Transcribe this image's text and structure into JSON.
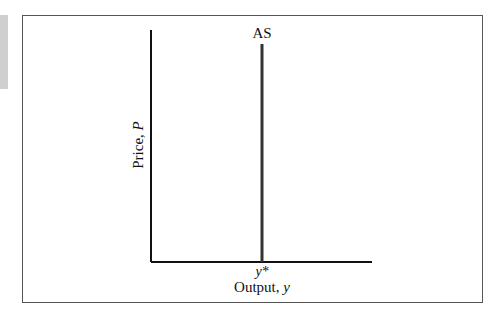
{
  "figure": {
    "curve_label": "AS",
    "y_axis_label_prefix": "Price, ",
    "y_axis_label_var": "P",
    "x_axis_label_prefix": "Output, ",
    "x_axis_label_var": "y",
    "tick_label": "y*"
  },
  "colors": {
    "axis": "#111111",
    "curve": "#333333",
    "frame": "#555555",
    "side_strip": "#cfcfcf"
  }
}
